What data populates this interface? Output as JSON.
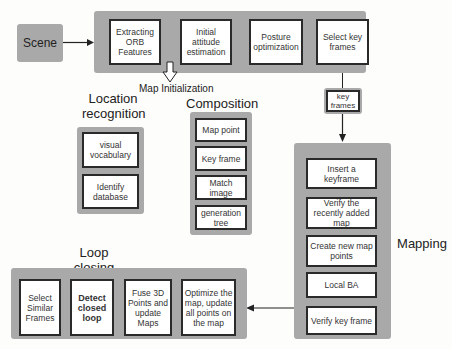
{
  "scene": {
    "label": "Scene"
  },
  "tracking": {
    "steps": [
      "Extracting ORB Features",
      "Initial attitude estimation",
      "Posture optimization",
      "Select key frames"
    ],
    "map_init_label": "Map Initialization"
  },
  "key_frames_node": {
    "label": "key frames"
  },
  "location_recognition": {
    "title": "Location recognition",
    "items": [
      "visual vocabulary",
      "Identify database"
    ]
  },
  "composition": {
    "title": "Composition",
    "items": [
      "Map point",
      "Key frame",
      "Match image",
      "generation tree"
    ]
  },
  "mapping": {
    "title": "Mapping",
    "items": [
      "Insert a keyframe",
      "Verify the recently added map",
      "Create new map points",
      "Local BA",
      "Verify key frame"
    ]
  },
  "loop_closing": {
    "title": "Loop closing",
    "items": [
      "Select Similar Frames",
      "Detect closed loop",
      "Fuse 3D Points and update Maps",
      "Optimize the map, update all points on the map"
    ]
  },
  "colors": {
    "panel": "#a9a9a9",
    "box_border": "#2a2a2a",
    "background": "#fdfdfb"
  }
}
